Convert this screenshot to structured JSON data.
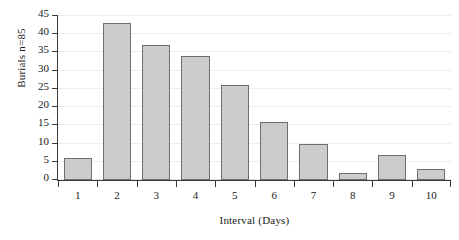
{
  "chart_data": {
    "type": "bar",
    "title": "",
    "xlabel": "Interval (Days)",
    "ylabel": "Burials  n=85",
    "categories": [
      "1",
      "2",
      "3",
      "4",
      "5",
      "6",
      "7",
      "8",
      "9",
      "10"
    ],
    "values": [
      6,
      43,
      37,
      34,
      26,
      16,
      10,
      2,
      7,
      3
    ],
    "ylim": [
      0,
      45
    ],
    "yticks": [
      0,
      5,
      10,
      15,
      20,
      25,
      30,
      35,
      40,
      45
    ],
    "ytick_labels": [
      "0",
      "5",
      "10",
      "15",
      "20",
      "25",
      "30",
      "35",
      "40",
      "45"
    ],
    "grid": true,
    "grid_axis": "y",
    "legend": false,
    "bar_fill_color": "#cccccc",
    "bar_edge_color": "#6e6e6e",
    "axis_color": "#3a3a3a",
    "grid_color": "#ededed",
    "background_color": "#ffffff",
    "series": [
      {
        "name": "Burials",
        "values": [
          6,
          43,
          37,
          34,
          26,
          16,
          10,
          2,
          7,
          3
        ]
      }
    ]
  }
}
